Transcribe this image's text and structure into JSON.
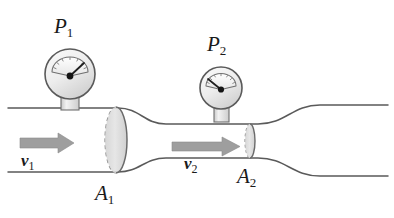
{
  "figure": {
    "type": "fluid-flow-pipe-diagram",
    "background_color": "#ffffff",
    "line_color": "#5a5a5a",
    "arrow_color": "#9a9a9a",
    "ellipse_fill": "#d8d8d8",
    "gauge_fill": "#ececec"
  },
  "gauges": [
    {
      "id": "gauge-1",
      "label_base": "P",
      "label_sub": "1",
      "needle_direction": "up-right",
      "cx": 70,
      "cy": 74,
      "r": 25
    },
    {
      "id": "gauge-2",
      "label_base": "P",
      "label_sub": "2",
      "needle_direction": "up-left",
      "cx": 221,
      "cy": 88,
      "r": 21
    }
  ],
  "velocities": [
    {
      "id": "velocity-1",
      "label_base": "v",
      "label_sub": "1",
      "arrow_from_x": 20,
      "arrow_to_x": 72,
      "arrow_y": 143
    },
    {
      "id": "velocity-2",
      "label_base": "v",
      "label_sub": "2",
      "arrow_from_x": 172,
      "arrow_to_x": 238,
      "arrow_y": 146
    }
  ],
  "areas": [
    {
      "id": "area-1",
      "label_base": "A",
      "label_sub": "1",
      "cx": 116,
      "cy": 140,
      "rx": 11,
      "ry": 33
    },
    {
      "id": "area-2",
      "label_base": "A",
      "label_sub": "2",
      "cx": 250,
      "cy": 141,
      "rx": 5,
      "ry": 17
    }
  ],
  "pipe": {
    "wide_top_y": 108,
    "wide_bottom_y": 172,
    "throat_top_y": 124,
    "throat_bottom_y": 158,
    "left_end_x": 8,
    "right_end_x": 388
  }
}
